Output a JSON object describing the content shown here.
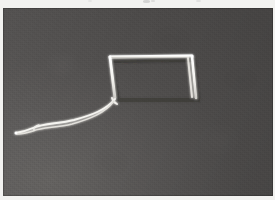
{
  "image": {
    "kind": "scanned-photograph",
    "caption": "White wire rectangle frame with trailing curved wire tail on dark grey background",
    "medium": "black-and-white photograph",
    "orientation": "landscape",
    "plate": {
      "left": 3,
      "top": 8,
      "width": 270,
      "height": 188
    },
    "page_background_color": "#f2f2f0"
  },
  "palette": {
    "backdrop_dark": "#4a4847",
    "backdrop_mid": "#555453",
    "backdrop_light": "#63615f",
    "subject_white": "#f6f5f1",
    "subject_highlight": "#ffffff",
    "subject_shadow": "#9a9895",
    "page_white": "#f2f2f0"
  },
  "subject": {
    "name": "wire-rectangle-with-tail",
    "description": "A slender white rectangular loop tilted slightly, with a long doubled wire tail curving down to the lower left",
    "frame": {
      "name": "rectangle-loop",
      "corners": {
        "top_left": {
          "x": 110,
          "y": 57
        },
        "top_right": {
          "x": 192,
          "y": 56
        },
        "bottom_right": {
          "x": 196,
          "y": 98
        },
        "bottom_left": {
          "x": 115,
          "y": 98
        }
      },
      "stroke_width": 2.6,
      "right_edge_doubled": true
    },
    "tail": {
      "name": "wire-tail",
      "strand_count": 2,
      "attach_point": {
        "x": 115,
        "y": 99
      },
      "free_end": {
        "x": 16,
        "y": 133
      },
      "stroke_width": 1.8,
      "path_upper": "M115,99 C106,110 92,115 74,120 C58,124 44,123 33,128 C26,131 21,132 16,133",
      "path_lower": "M114,101 C105,113 90,119 72,124 C56,128 43,127 33,131 C27,133 22,134 17,134"
    }
  },
  "artifacts": {
    "name": "scan-artifacts",
    "description": "Faint smudges clipped at the very top white margin of the scan",
    "count": 4
  }
}
